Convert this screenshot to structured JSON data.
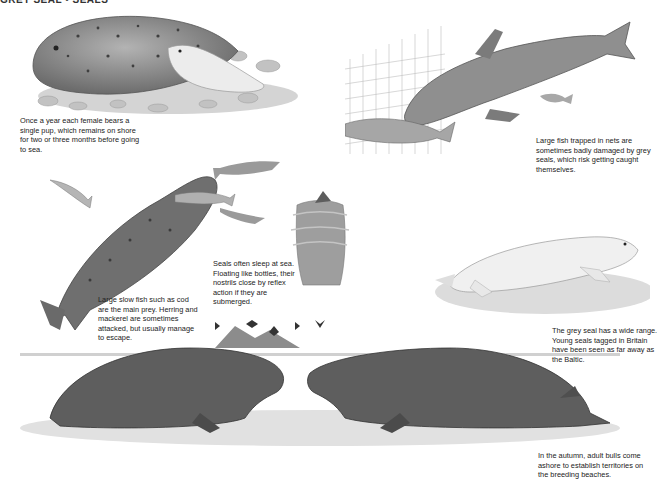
{
  "header": {
    "text": "GREY SEAL • SEALS"
  },
  "illustrations": [
    {
      "id": "mother-and-pup",
      "subject": "Female grey seal lying on pebbles with white-coated pup"
    },
    {
      "id": "seal-at-net",
      "subject": "Grey seal swimming near fishing net attacking a large fish"
    },
    {
      "id": "seal-hunting-fish",
      "subject": "Grey seal swimming upward catching a fish, surrounded by small fish"
    },
    {
      "id": "bottling-seal",
      "subject": "Seal sleeping upright in water, head just above surface"
    },
    {
      "id": "white-pup",
      "subject": "White-coated grey seal pup resting on sand"
    },
    {
      "id": "bulls-facing-off",
      "subject": "Two adult bull grey seals facing each other on a beach, island and seabirds behind"
    }
  ],
  "captions": {
    "pup": "Once a year each female bears a single pup, which remains on shore for two or three months before going to sea.",
    "nets": "Large fish trapped in nets are sometimes badly damaged by grey seals, which risk getting caught themselves.",
    "prey": "Large slow fish such as cod are the main prey. Herring and mackerel are sometimes attacked, but usually manage to escape.",
    "sleep": "Seals often sleep at sea. Floating like bottles, their nostrils close by reflex action if they are submerged.",
    "range": "The grey seal has a wide range. Young seals tagged in Britain have been seen as far away as the Baltic.",
    "bulls": "In the autumn, adult bulls come ashore to establish territories on the breeding beaches."
  },
  "colors": {
    "background": "#ffffff",
    "text": "#222222",
    "seal_dark": "#5a5a5a",
    "seal_mid": "#8d8d8d",
    "pup_white": "#ececec",
    "ground": "#c9c9c9"
  }
}
